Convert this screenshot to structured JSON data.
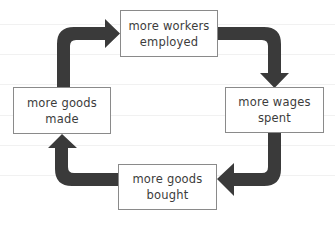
{
  "diagram": {
    "type": "cycle",
    "arrow_color": "#3a3a3a",
    "nodes": [
      {
        "id": "workers",
        "line1": "more workers",
        "line2": "employed"
      },
      {
        "id": "wages",
        "line1": "more wages",
        "line2": "spent"
      },
      {
        "id": "bought",
        "line1": "more goods",
        "line2": "bought"
      },
      {
        "id": "made",
        "line1": "more goods",
        "line2": "made"
      }
    ],
    "edges": [
      {
        "from": "workers",
        "to": "wages"
      },
      {
        "from": "wages",
        "to": "bought"
      },
      {
        "from": "bought",
        "to": "made"
      },
      {
        "from": "made",
        "to": "workers"
      }
    ]
  }
}
